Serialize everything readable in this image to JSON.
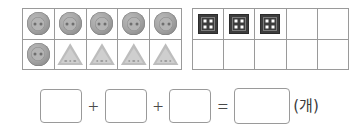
{
  "worksheet": {
    "type": "counting-addition-exercise",
    "language": "ko"
  },
  "grids": [
    {
      "name": "left-grid",
      "columns": 5,
      "rows": 2,
      "cells": [
        {
          "token": "round-button"
        },
        {
          "token": "round-button"
        },
        {
          "token": "round-button"
        },
        {
          "token": "round-button"
        },
        {
          "token": "round-button"
        },
        {
          "token": "round-button"
        },
        {
          "token": "triangle-button"
        },
        {
          "token": "triangle-button"
        },
        {
          "token": "triangle-button"
        },
        {
          "token": "triangle-button"
        }
      ]
    },
    {
      "name": "right-grid",
      "columns": 5,
      "rows": 2,
      "cells": [
        {
          "token": "square-button"
        },
        {
          "token": "square-button"
        },
        {
          "token": "square-button"
        },
        {
          "token": "empty"
        },
        {
          "token": "empty"
        },
        {
          "token": "empty"
        },
        {
          "token": "empty"
        },
        {
          "token": "empty"
        },
        {
          "token": "empty"
        },
        {
          "token": "empty"
        }
      ]
    }
  ],
  "equation": {
    "operands": [
      {
        "name": "addend-1",
        "value": ""
      },
      {
        "name": "addend-2",
        "value": ""
      },
      {
        "name": "addend-3",
        "value": ""
      }
    ],
    "result": {
      "name": "sum",
      "value": ""
    },
    "operator_plus": "+",
    "operator_equals": "=",
    "unit_label": "(개)"
  },
  "colors": {
    "grid_line": "#9a9a9a",
    "round_token": "#a5a5a5",
    "triangle_token": "#bdbdbd",
    "square_token": "#3d3d3d",
    "square_token_dot": "#ffffff",
    "box_border": "#9a9a9a",
    "text": "#3a3a3a",
    "background": "#ffffff"
  }
}
